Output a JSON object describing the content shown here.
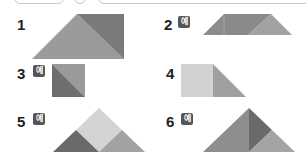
{
  "header": {
    "top_boxes": [
      "",
      "",
      ""
    ]
  },
  "problems": [
    {
      "number": "1",
      "badge": null
    },
    {
      "number": "2",
      "badge": "예"
    },
    {
      "number": "3",
      "badge": "예"
    },
    {
      "number": "4",
      "badge": null
    },
    {
      "number": "5",
      "badge": "예"
    },
    {
      "number": "6",
      "badge": "예"
    }
  ],
  "colors": {
    "dark": "#6e6e6e",
    "medium": "#9a9a9a",
    "light": "#c4c4c4",
    "lighter": "#d6d6d6",
    "badge": "#555555"
  }
}
